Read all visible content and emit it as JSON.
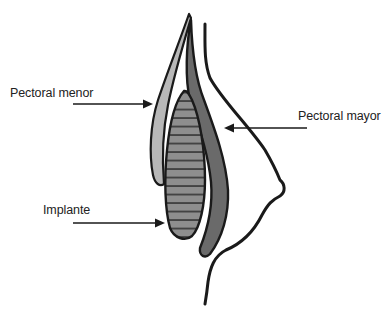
{
  "diagram": {
    "type": "anatomical-cross-section",
    "labels": {
      "pectoral_menor": "Pectoral menor",
      "pectoral_mayor": "Pectoral mayor",
      "implante": "Implante"
    },
    "colors": {
      "outline": "#1a1a1a",
      "pectoral_menor_fill": "#b8b8b8",
      "pectoral_mayor_fill": "#6a6a6a",
      "implant_fill": "#8c8c8c",
      "implant_stripes": "#2a2a2a",
      "background": "#ffffff"
    }
  }
}
